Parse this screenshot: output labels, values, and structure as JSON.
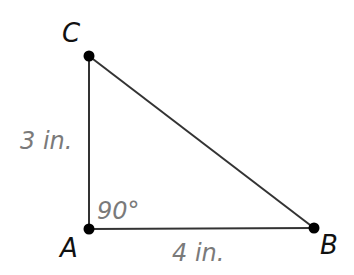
{
  "diagram": {
    "type": "right-triangle",
    "colors": {
      "line": "#333333",
      "vertex_dot": "#000000",
      "vertex_label": "#111111",
      "measure_label": "#7a7a7a",
      "background": "#ffffff"
    },
    "vertices": {
      "A": {
        "label": "A",
        "x": 89,
        "y": 229
      },
      "B": {
        "label": "B",
        "x": 314,
        "y": 228
      },
      "C": {
        "label": "C",
        "x": 89,
        "y": 56
      }
    },
    "sides": {
      "AC": {
        "label": "3 in."
      },
      "AB": {
        "label": "4 in."
      },
      "BC": {
        "label": ""
      }
    },
    "angles": {
      "A": {
        "label": "90°"
      }
    }
  }
}
